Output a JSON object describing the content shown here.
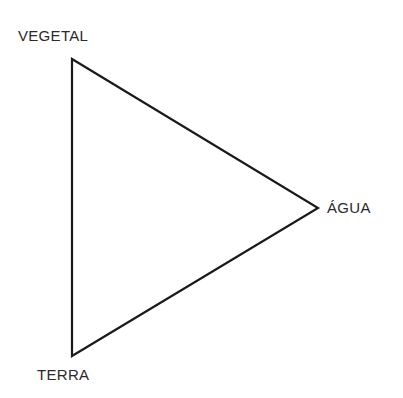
{
  "diagram": {
    "type": "triangle",
    "vertices": [
      {
        "id": "vegetal",
        "label": "VEGETAL",
        "x": 72,
        "y": 59
      },
      {
        "id": "agua",
        "label": "ÁGUA",
        "x": 318,
        "y": 208
      },
      {
        "id": "terra",
        "label": "TERRA",
        "x": 72,
        "y": 356
      }
    ],
    "stroke_color": "#1a1a1a",
    "label_color": "#2a2a2a"
  }
}
